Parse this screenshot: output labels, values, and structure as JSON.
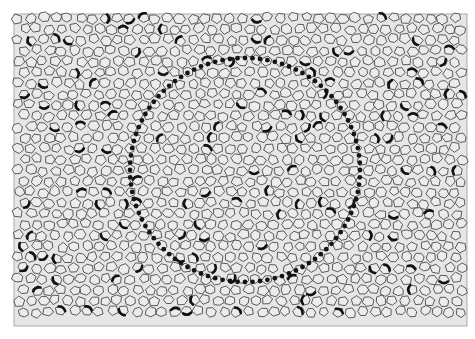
{
  "figure": {
    "colors": {
      "background": "#ffffff",
      "tissue_fill": "#e6e6e6",
      "cell_fill": "#ececec",
      "cell_outline": "#4a4a4a",
      "dark_cell_marking": "#111111",
      "circle_dots": "#141414"
    },
    "frame": {
      "x": 14,
      "y": 14,
      "width": 453,
      "height": 312
    },
    "circle": {
      "cx": 245,
      "cy": 170,
      "rx": 115,
      "ry": 112,
      "dot_count": 96,
      "dot_radius": 2.4
    },
    "cells": {
      "spacing": 12.5,
      "seed": 7,
      "dark_fraction": 0.12
    }
  }
}
